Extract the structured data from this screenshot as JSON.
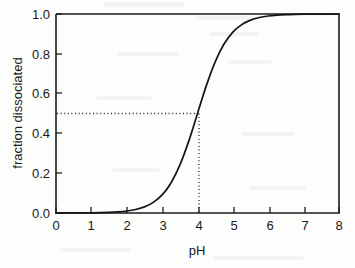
{
  "chart_data": {
    "type": "line",
    "title": "",
    "xlabel": "pH",
    "ylabel": "fraction dissociated",
    "xlim": [
      0,
      8
    ],
    "ylim": [
      0.0,
      1.0
    ],
    "grid": false,
    "legend": "none",
    "xticks": [
      "0",
      "1",
      "2",
      "3",
      "4",
      "5",
      "6",
      "7",
      "8"
    ],
    "xtick_values": [
      0,
      1,
      2,
      3,
      4,
      5,
      6,
      7,
      8
    ],
    "yticks": [
      "0.0",
      "0.2",
      "0.4",
      "0.6",
      "0.8",
      "1.0"
    ],
    "ytick_values": [
      0.0,
      0.2,
      0.4,
      0.6,
      0.8,
      1.0
    ],
    "series": [
      {
        "name": "fraction dissociated",
        "style": "solid",
        "x": [
          0.0,
          0.25,
          0.5,
          0.75,
          1.0,
          1.25,
          1.5,
          1.75,
          2.0,
          2.25,
          2.5,
          2.75,
          3.0,
          3.25,
          3.5,
          3.75,
          4.0,
          4.25,
          4.5,
          4.75,
          5.0,
          5.25,
          5.5,
          5.75,
          6.0,
          6.25,
          6.5,
          6.75,
          7.0,
          7.25,
          7.5,
          7.75,
          8.0
        ],
        "values": [
          0.0001,
          0.0002,
          0.0003,
          0.0006,
          0.001,
          0.0018,
          0.0031,
          0.0056,
          0.0099,
          0.0174,
          0.0306,
          0.0532,
          0.0909,
          0.151,
          0.2403,
          0.3599,
          0.5,
          0.6401,
          0.7597,
          0.849,
          0.9091,
          0.9468,
          0.9694,
          0.9826,
          0.9901,
          0.9944,
          0.9968,
          0.9982,
          0.999,
          0.9994,
          0.9997,
          0.9998,
          0.9999
        ]
      }
    ],
    "annotations": [
      {
        "name": "half-dissociation-guide-horizontal",
        "style": "dotted",
        "from": [
          0,
          0.5
        ],
        "to": [
          4,
          0.5
        ]
      },
      {
        "name": "half-dissociation-guide-vertical",
        "style": "dotted",
        "from": [
          4,
          0.0
        ],
        "to": [
          4,
          0.5
        ]
      }
    ],
    "pka": 4.0,
    "half_dissociation_point": [
      4.0,
      0.5
    ]
  },
  "axes": {
    "x_title": "pH",
    "y_title": "fraction dissociated"
  }
}
